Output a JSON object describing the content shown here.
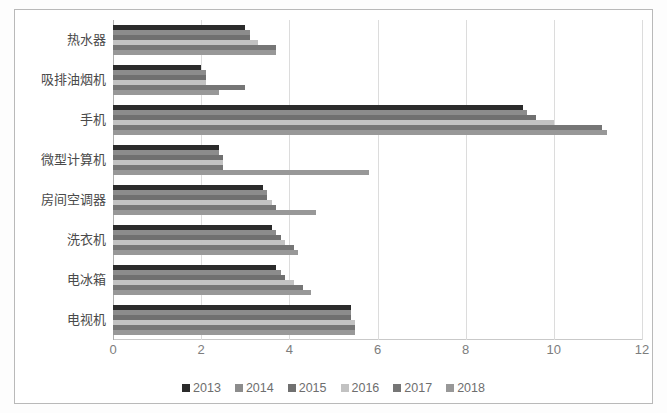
{
  "chart_data": {
    "type": "bar",
    "orientation": "horizontal",
    "title": "",
    "xlabel": "",
    "ylabel": "",
    "xlim": [
      0,
      12
    ],
    "xticks": [
      "0",
      "2",
      "4",
      "6",
      "8",
      "10",
      "12"
    ],
    "grid": true,
    "legend_position": "bottom",
    "categories": [
      "热水器",
      "吸排油烟机",
      "手机",
      "微型计算机",
      "房间空调器",
      "洗衣机",
      "电冰箱",
      "电视机"
    ],
    "series": [
      {
        "name": "2013",
        "color": "#2b2b2b",
        "values": [
          3.0,
          2.0,
          9.3,
          2.4,
          3.4,
          3.6,
          3.7,
          5.4
        ]
      },
      {
        "name": "2014",
        "color": "#8c8c8c",
        "values": [
          3.1,
          2.1,
          9.4,
          2.4,
          3.5,
          3.7,
          3.8,
          5.4
        ]
      },
      {
        "name": "2015",
        "color": "#707070",
        "values": [
          3.1,
          2.1,
          9.6,
          2.5,
          3.5,
          3.8,
          3.9,
          5.4
        ]
      },
      {
        "name": "2016",
        "color": "#c2c2c2",
        "values": [
          3.3,
          2.1,
          10.0,
          2.5,
          3.6,
          3.9,
          4.1,
          5.5
        ]
      },
      {
        "name": "2017",
        "color": "#767676",
        "values": [
          3.7,
          3.0,
          11.1,
          2.5,
          3.7,
          4.1,
          4.3,
          5.5
        ]
      },
      {
        "name": "2018",
        "color": "#989898",
        "values": [
          3.7,
          2.4,
          11.2,
          5.8,
          4.6,
          4.2,
          4.5,
          5.5
        ]
      }
    ]
  }
}
